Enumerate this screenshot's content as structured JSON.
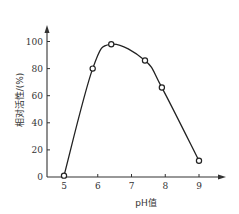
{
  "chart_data": {
    "type": "line",
    "title": "",
    "xlabel": "pH值",
    "ylabel": "相对活性/(%)",
    "xlim": [
      5,
      9
    ],
    "ylim": [
      0,
      100
    ],
    "x_ticks": [
      5,
      6,
      7,
      8,
      9
    ],
    "y_ticks": [
      0,
      20,
      40,
      60,
      80,
      100
    ],
    "grid": false,
    "legend": null,
    "series": [
      {
        "name": "相对活性",
        "marker": "open-circle",
        "smooth": true,
        "x": [
          5.0,
          5.85,
          6.4,
          7.4,
          7.9,
          9.0
        ],
        "y": [
          1,
          80,
          98,
          86,
          66,
          12
        ]
      }
    ]
  },
  "labels": {
    "xlabel": "pH值",
    "ylabel": "相对活性/(%)",
    "x_ticks": [
      "5",
      "6",
      "7",
      "8",
      "9"
    ],
    "y_ticks": [
      "0",
      "20",
      "40",
      "60",
      "80",
      "100"
    ]
  },
  "colors": {
    "line": "#222222",
    "axis": "#333333",
    "background": "#ffffff"
  }
}
